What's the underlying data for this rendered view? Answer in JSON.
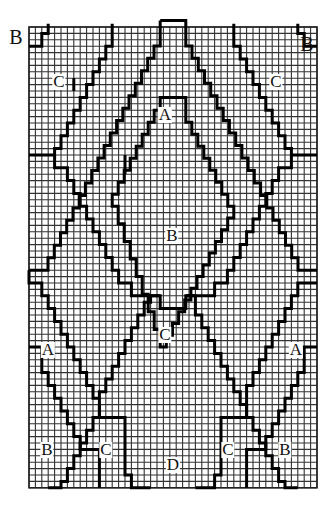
{
  "diagram": {
    "type": "bargello-stitch-chart",
    "grid": {
      "cols": 45,
      "rows": 72,
      "cell": 6.4,
      "origin_x": 29,
      "origin_y": 27
    },
    "colors": {
      "grid_line": "#333333",
      "pattern_line": "#000000",
      "background": "#ffffff"
    },
    "labels": [
      {
        "id": "corner-b-left",
        "text": "B",
        "x": 16,
        "y": 37,
        "corner": true
      },
      {
        "id": "corner-b-right",
        "text": "B",
        "x": 307,
        "y": 44,
        "corner": true
      },
      {
        "id": "c-top-left",
        "text": "C",
        "x": 59,
        "y": 82
      },
      {
        "id": "c-top-right",
        "text": "C",
        "x": 276,
        "y": 82
      },
      {
        "id": "a-top",
        "text": "A",
        "x": 165,
        "y": 115
      },
      {
        "id": "b-middle",
        "text": "B",
        "x": 172,
        "y": 236
      },
      {
        "id": "c-middle",
        "text": "C",
        "x": 165,
        "y": 335
      },
      {
        "id": "a-left",
        "text": "A",
        "x": 48,
        "y": 350
      },
      {
        "id": "a-right",
        "text": "A",
        "x": 296,
        "y": 350
      },
      {
        "id": "b-bottom-left",
        "text": "B",
        "x": 47,
        "y": 450
      },
      {
        "id": "c-bottom-left",
        "text": "C",
        "x": 106,
        "y": 450
      },
      {
        "id": "d-bottom",
        "text": "D",
        "x": 173,
        "y": 465
      },
      {
        "id": "c-bottom-right",
        "text": "C",
        "x": 228,
        "y": 450
      },
      {
        "id": "b-bottom-right",
        "text": "B",
        "x": 285,
        "y": 450
      }
    ],
    "lines": [
      [
        [
          3,
          -0.5
        ],
        [
          3,
          1
        ],
        [
          2,
          1
        ],
        [
          2,
          3
        ],
        [
          0,
          3
        ]
      ],
      [
        [
          42,
          -0.5
        ],
        [
          42,
          1
        ],
        [
          43,
          1
        ],
        [
          43,
          3
        ],
        [
          45,
          3
        ]
      ],
      [
        [
          13,
          -0.5
        ],
        [
          13,
          1
        ],
        [
          4,
          19
        ],
        [
          4,
          20
        ],
        [
          0,
          20
        ]
      ],
      [
        [
          32,
          -0.5
        ],
        [
          32,
          1
        ],
        [
          41,
          19
        ],
        [
          41,
          20
        ],
        [
          45,
          20
        ]
      ],
      [
        [
          20.5,
          -1
        ],
        [
          24.5,
          -1
        ],
        [
          24.5,
          1
        ]
      ],
      [
        [
          20.5,
          -1
        ],
        [
          20.5,
          1
        ],
        [
          2,
          38
        ],
        [
          0,
          38
        ]
      ],
      [
        [
          24.5,
          1
        ],
        [
          43,
          38
        ],
        [
          45,
          38
        ]
      ],
      [
        [
          7,
          8
        ],
        [
          7,
          10
        ]
      ],
      [
        [
          15,
          20
        ],
        [
          15,
          23
        ]
      ],
      [
        [
          0,
          38
        ],
        [
          0,
          40
        ],
        [
          2,
          40
        ],
        [
          11,
          58
        ],
        [
          11,
          59
        ],
        [
          19,
          43
        ],
        [
          19,
          42
        ],
        [
          20.5,
          42
        ],
        [
          20.5,
          44
        ],
        [
          24.5,
          44
        ],
        [
          24.5,
          42
        ],
        [
          26,
          42
        ],
        [
          26,
          43
        ],
        [
          34,
          59
        ],
        [
          34,
          58
        ],
        [
          43,
          40
        ],
        [
          45,
          40
        ]
      ],
      [
        [
          4,
          20
        ],
        [
          4,
          22
        ],
        [
          6,
          22
        ],
        [
          15,
          40
        ],
        [
          16,
          40
        ],
        [
          16,
          42
        ],
        [
          20.5,
          42
        ]
      ],
      [
        [
          41,
          20
        ],
        [
          41,
          22
        ],
        [
          39,
          22
        ],
        [
          30,
          40
        ],
        [
          29,
          40
        ],
        [
          29,
          42
        ],
        [
          24.5,
          42
        ]
      ],
      [
        [
          20.5,
          13
        ],
        [
          20.5,
          11
        ],
        [
          24.5,
          11
        ],
        [
          24.5,
          13
        ],
        [
          32,
          28
        ],
        [
          20.5,
          50
        ],
        [
          13,
          28
        ],
        [
          20.5,
          13
        ]
      ],
      [
        [
          0,
          50
        ],
        [
          2,
          50
        ],
        [
          2,
          52
        ],
        [
          8,
          64
        ],
        [
          8,
          66
        ],
        [
          11,
          66
        ],
        [
          11,
          72
        ]
      ],
      [
        [
          45,
          50
        ],
        [
          43,
          50
        ],
        [
          43,
          52
        ],
        [
          37,
          64
        ],
        [
          37,
          66
        ],
        [
          34,
          66
        ],
        [
          34,
          72
        ]
      ],
      [
        [
          11,
          59
        ],
        [
          11,
          61
        ],
        [
          15,
          61
        ],
        [
          15,
          68
        ],
        [
          19,
          76
        ]
      ],
      [
        [
          34,
          59
        ],
        [
          34,
          61
        ],
        [
          30,
          61
        ],
        [
          30,
          68
        ],
        [
          26,
          76
        ]
      ],
      [
        [
          11,
          59
        ],
        [
          3,
          75
        ]
      ],
      [
        [
          34,
          59
        ],
        [
          42,
          75
        ]
      ]
    ]
  }
}
